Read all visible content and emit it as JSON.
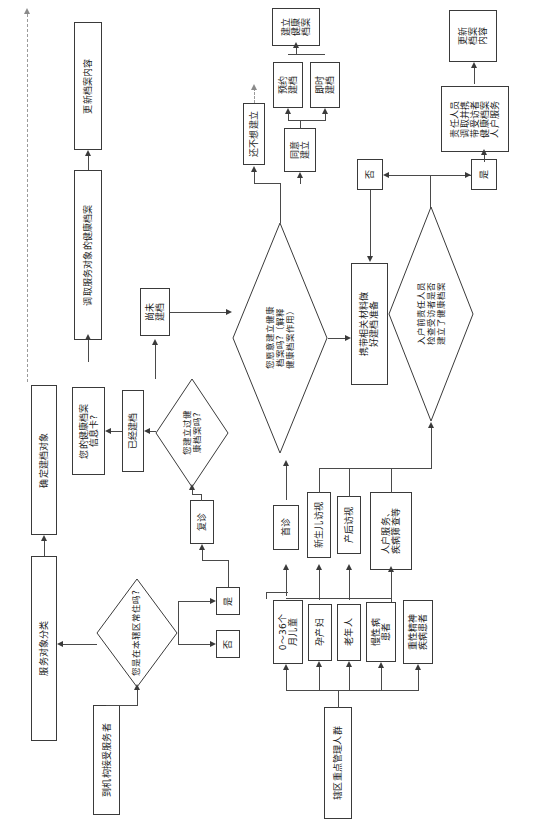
{
  "diagram": {
    "orientation": "rotated-90-ccw",
    "nodes": {
      "service_target_classification": "服务对象分类",
      "confirm_filing_target": "确定建档对象",
      "institution_service_receiver": "到机构接受服务者",
      "resident_question": "您是在本辖区常住吗?",
      "resident_no": "否",
      "resident_yes": "是",
      "first_visit": "首诊",
      "return_visit": "复诊",
      "newborn_visit": "新生儿访视",
      "postpartum_visit": "产后访视",
      "home_service_screening": "人户服务、\n疾病筛查等",
      "key_population": "辖区重点管理人群",
      "pop_children": "0～36个\n月儿童",
      "pop_pregnant": "孕产妇",
      "pop_elderly": "老年人",
      "pop_chronic": "慢性病\n患者",
      "pop_mental": "重性精神\n疾病患者",
      "has_record_question": "您建立过健\n康档案吗?",
      "already_filed": "已经建档",
      "not_yet_filed": "尚未\n建档",
      "health_record_card": "您的健康档案\n信息卡?",
      "willing_question": "您愿意建立健康\n档案吗?（解释\n健康档案作用）",
      "not_want_yet": "还不想建立",
      "agree_to_build": "同意\n建立",
      "appointment_filing": "预约\n建档",
      "immediate_filing": "即时\n建档",
      "build_health_record": "建立\n健康\n档案",
      "bring_materials": "携带相关材料做\n好建档准备",
      "home_visit_check_question": "入户前责任人员\n检查受访者是否\n建立了健康档案",
      "check_no": "否",
      "check_yes": "是",
      "staff_carry_record": "责任人员\n调取并携\n带受访者\n健康档案\n人户服务",
      "update_record_content_right": "更新\n档案\n内容",
      "retrieve_record": "调取服务对象的健康档案",
      "update_record_content_left": "更新档案内容"
    },
    "edge_labels": {
      "resident_no": "否",
      "resident_yes": "是",
      "check_no": "否",
      "check_yes": "是"
    },
    "colors": {
      "stroke": "#3a3a3a",
      "text": "#1a1a1a",
      "background": "#ffffff",
      "dashed": "#9a9a9a"
    }
  }
}
